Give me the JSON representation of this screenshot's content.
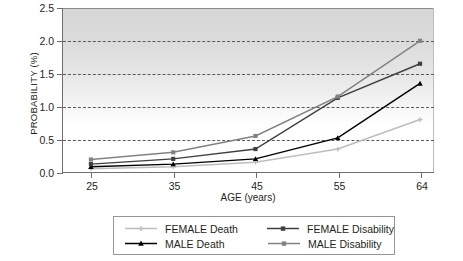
{
  "chart_data": {
    "type": "line",
    "title": "",
    "xlabel": "AGE (years)",
    "ylabel": "PROBABILITY (%)",
    "x": [
      25,
      35,
      45,
      55,
      64
    ],
    "categories": [
      "25",
      "35",
      "45",
      "55",
      "64"
    ],
    "xlim": [
      25,
      64
    ],
    "ylim": [
      0.0,
      2.5
    ],
    "yticks": [
      "0.0",
      "0.5",
      "1.0",
      "1.5",
      "2.0",
      "2.5"
    ],
    "ytick_values": [
      0.0,
      0.5,
      1.0,
      1.5,
      2.0,
      2.5
    ],
    "gridlines": [
      0.5,
      1.0,
      1.5,
      2.0
    ],
    "grid": "horizontal-dashed",
    "legend_position": "below-center",
    "series": [
      {
        "name": "FEMALE Death",
        "values": [
          0.05,
          0.08,
          0.15,
          0.35,
          0.8
        ],
        "color": "#bcbdbf",
        "marker": "plus"
      },
      {
        "name": "MALE Death",
        "values": [
          0.08,
          0.12,
          0.2,
          0.52,
          1.35
        ],
        "color": "#000000",
        "marker": "triangle"
      },
      {
        "name": "FEMALE Disability",
        "values": [
          0.12,
          0.2,
          0.35,
          1.13,
          1.65
        ],
        "color": "#404041",
        "marker": "square"
      },
      {
        "name": "MALE Disability",
        "values": [
          0.19,
          0.3,
          0.55,
          1.15,
          2.0
        ],
        "color": "#808285",
        "marker": "square"
      }
    ]
  },
  "legend": {
    "rows": [
      [
        {
          "label": "FEMALE Death",
          "color": "#bcbdbf",
          "marker": "plus"
        },
        {
          "label": "FEMALE Disability",
          "color": "#404041",
          "marker": "square"
        }
      ],
      [
        {
          "label": "MALE Death",
          "color": "#000000",
          "marker": "triangle"
        },
        {
          "label": "MALE Disability",
          "color": "#808285",
          "marker": "square"
        }
      ]
    ]
  }
}
